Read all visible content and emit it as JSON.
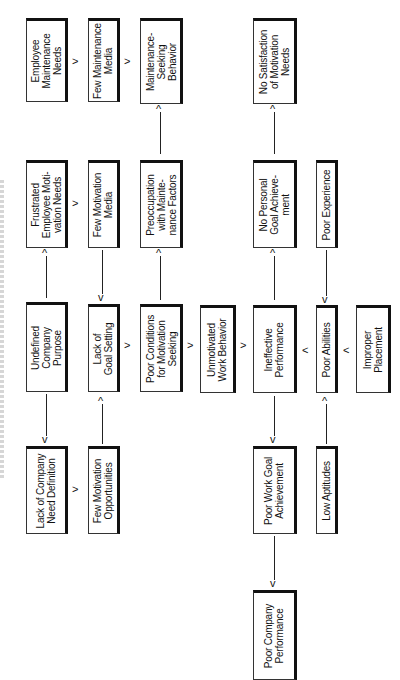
{
  "diagram": {
    "orientation": "rotated 90 degrees counter-clockwise; text reads bottom-to-top",
    "boxes": [
      {
        "id": "employee-maintenance-needs",
        "label": "Employee\nMaintenance\nNeeds"
      },
      {
        "id": "few-maintenance-media",
        "label": "Few Maintenance\nMedia"
      },
      {
        "id": "maintenance-seeking-behavior",
        "label": "Maintenance-\nSeeking\nBehavior"
      },
      {
        "id": "no-satisfaction-motivation-needs",
        "label": "No Satisfaction\nof Motivation\nNeeds"
      },
      {
        "id": "frustrated-employee-motivation-needs",
        "label": "Frustrated\nEmployee Moti-\nvation Needs"
      },
      {
        "id": "few-motivation-media",
        "label": "Few Motivation\nMedia"
      },
      {
        "id": "preoccupation-maintenance-factors",
        "label": "Preoccupation\nwith Mainte-\nnance Factors"
      },
      {
        "id": "no-personal-goal-achievement",
        "label": "No Personal\nGoal Achieve-\nment"
      },
      {
        "id": "poor-experience",
        "label": "Poor Experience"
      },
      {
        "id": "undefined-company-purpose",
        "label": "Undefined\nCompany\nPurpose"
      },
      {
        "id": "lack-of-goal-setting",
        "label": "Lack of\nGoal Setting"
      },
      {
        "id": "poor-conditions-motivation-seeking",
        "label": "Poor Conditions\nfor Motivation\nSeeking"
      },
      {
        "id": "unmotivated-work-behavior",
        "label": "Unmotivated\nWork Behavior"
      },
      {
        "id": "ineffective-performance",
        "label": "Ineffective\nPerformance"
      },
      {
        "id": "poor-abilities",
        "label": "Poor Abilities"
      },
      {
        "id": "improper-placement",
        "label": "Improper\nPlacement"
      },
      {
        "id": "lack-company-need-definition",
        "label": "Lack of Company\nNeed Definition"
      },
      {
        "id": "few-motivation-opportunities",
        "label": "Few Motivation\nOpportunities"
      },
      {
        "id": "poor-work-goal-achievement",
        "label": "Poor Work Goal\nAchievement"
      },
      {
        "id": "low-aptitudes",
        "label": "Low Aptitudes"
      },
      {
        "id": "poor-company-performance",
        "label": "Poor Company\nPerformance"
      }
    ],
    "arrows": [
      {
        "from": "employee-maintenance-needs",
        "to": "few-maintenance-media"
      },
      {
        "from": "few-maintenance-media",
        "to": "maintenance-seeking-behavior"
      },
      {
        "from": "preoccupation-maintenance-factors",
        "to": "maintenance-seeking-behavior"
      },
      {
        "from": "no-personal-goal-achievement",
        "to": "no-satisfaction-motivation-needs"
      },
      {
        "from": "undefined-company-purpose",
        "to": "frustrated-employee-motivation-needs"
      },
      {
        "from": "frustrated-employee-motivation-needs",
        "to": "few-motivation-media"
      },
      {
        "from": "few-motivation-media",
        "to": "lack-of-goal-setting"
      },
      {
        "from": "poor-conditions-motivation-seeking",
        "to": "preoccupation-maintenance-factors"
      },
      {
        "from": "poor-experience",
        "to": "poor-abilities"
      },
      {
        "from": "undefined-company-purpose",
        "to": "lack-company-need-definition"
      },
      {
        "from": "few-motivation-opportunities",
        "to": "lack-of-goal-setting"
      },
      {
        "from": "lack-company-need-definition",
        "to": "few-motivation-opportunities"
      },
      {
        "from": "lack-of-goal-setting",
        "to": "poor-conditions-motivation-seeking"
      },
      {
        "from": "poor-conditions-motivation-seeking",
        "to": "unmotivated-work-behavior"
      },
      {
        "from": "unmotivated-work-behavior",
        "to": "ineffective-performance"
      },
      {
        "from": "poor-abilities",
        "to": "ineffective-performance"
      },
      {
        "from": "improper-placement",
        "to": "poor-abilities"
      },
      {
        "from": "ineffective-performance",
        "to": "no-personal-goal-achievement"
      },
      {
        "from": "ineffective-performance",
        "to": "poor-work-goal-achievement"
      },
      {
        "from": "low-aptitudes",
        "to": "poor-abilities"
      },
      {
        "from": "poor-work-goal-achievement",
        "to": "poor-company-performance"
      }
    ]
  }
}
